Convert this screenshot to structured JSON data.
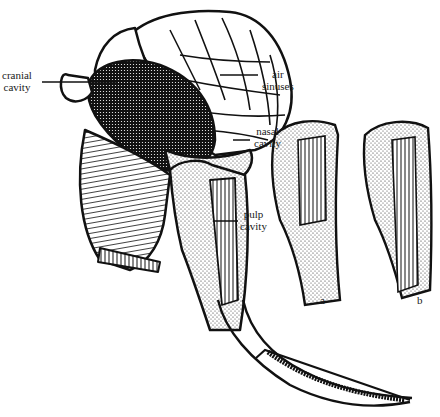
{
  "figure": {
    "labels": {
      "cranial_cavity": [
        "cranial",
        "cavity"
      ],
      "air_sinuses": [
        "air",
        "sinuses"
      ],
      "nasal_cavity": [
        "nasal",
        "cavity"
      ],
      "pulp_cavity": [
        "pulp",
        "cavity"
      ],
      "panel_a": "a",
      "panel_b": "b"
    },
    "colors": {
      "ink": "#1a1a1a",
      "paper": "#ffffff"
    }
  }
}
